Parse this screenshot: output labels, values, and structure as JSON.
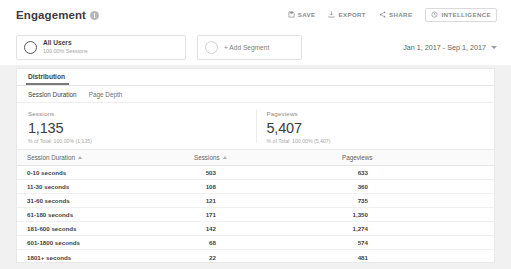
{
  "header": {
    "title": "Engagement",
    "info_icon": "info-icon",
    "tools": [
      {
        "label": "SAVE",
        "icon": "save-icon",
        "boxed": false
      },
      {
        "label": "EXPORT",
        "icon": "export-icon",
        "boxed": false
      },
      {
        "label": "SHARE",
        "icon": "share-icon",
        "boxed": false
      },
      {
        "label": "INTELLIGENCE",
        "icon": "intelligence-icon",
        "boxed": true
      }
    ]
  },
  "segments": {
    "all_users": {
      "name": "All Users",
      "sub": "100.00% Sessions"
    },
    "add_segment": {
      "label": "+ Add Segment"
    },
    "date_range": "Jan 1, 2017 - Sep 1, 2017"
  },
  "tabs": {
    "main": "Distribution",
    "sub": [
      {
        "label": "Session Duration",
        "active": true
      },
      {
        "label": "Page Depth",
        "active": false
      }
    ]
  },
  "metrics": [
    {
      "label": "Sessions",
      "value": "1,135",
      "sub": "% of Total: 100.00% (1,135)"
    },
    {
      "label": "Pageviews",
      "value": "5,407",
      "sub": "% of Total: 100.00% (5,407)"
    }
  ],
  "table": {
    "columns": [
      "Session Duration",
      "Sessions",
      "Pageviews"
    ],
    "rows": [
      {
        "dimension": "0-10 seconds",
        "sessions": "503",
        "pageviews": "633"
      },
      {
        "dimension": "11-30 seconds",
        "sessions": "108",
        "pageviews": "360"
      },
      {
        "dimension": "31-60 seconds",
        "sessions": "121",
        "pageviews": "735"
      },
      {
        "dimension": "61-180 seconds",
        "sessions": "171",
        "pageviews": "1,350"
      },
      {
        "dimension": "181-600 seconds",
        "sessions": "142",
        "pageviews": "1,274"
      },
      {
        "dimension": "601-1800 seconds",
        "sessions": "68",
        "pageviews": "574"
      },
      {
        "dimension": "1801+ seconds",
        "sessions": "22",
        "pageviews": "481"
      }
    ]
  },
  "chart_data": {
    "type": "bar",
    "categories": [
      "0-10 seconds",
      "11-30 seconds",
      "31-60 seconds",
      "61-180 seconds",
      "181-600 seconds",
      "601-1800 seconds",
      "1801+ seconds"
    ],
    "series": [
      {
        "name": "Sessions",
        "values": [
          503,
          108,
          121,
          171,
          142,
          68,
          22
        ],
        "color": "#6e6e6e",
        "max": 503
      },
      {
        "name": "Pageviews",
        "values": [
          633,
          360,
          735,
          1350,
          1274,
          574,
          481
        ],
        "color": "#dedede",
        "max": 1350
      }
    ],
    "xlabel": "Session Duration",
    "ylabel": "",
    "totals": {
      "sessions": 1135,
      "pageviews": 5407
    },
    "legend": "none",
    "grid": false
  },
  "colors": {
    "bar_sessions": "#6e6e6e",
    "bar_pageviews": "#dedede",
    "page_bg": "#f1f1f1",
    "card_bg": "#ffffff",
    "text": "#3f3f3f",
    "muted": "#8b8b8b"
  }
}
